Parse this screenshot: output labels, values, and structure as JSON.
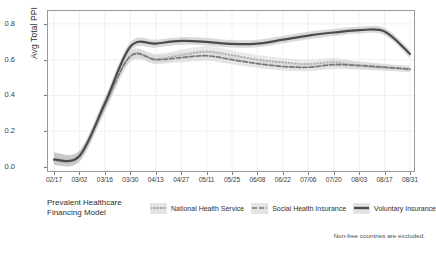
{
  "chart_data": {
    "type": "line",
    "title": "",
    "xlabel": "",
    "ylabel": "Avg Total PPI",
    "ylim": [
      0.0,
      0.85
    ],
    "yticks": [
      0.0,
      0.2,
      0.4,
      0.6,
      0.8
    ],
    "ytick_labels": [
      "0.0",
      "0.2",
      "0.4",
      "0.6",
      "0.8"
    ],
    "grid": true,
    "legend_position": "bottom-left",
    "legend_title": "Prevalent Healthcare Financing Model",
    "caption": "Non-free countries are excluded.",
    "x": [
      "02/17",
      "03/02",
      "03/16",
      "03/30",
      "04/13",
      "04/27",
      "05/11",
      "05/25",
      "06/08",
      "06/22",
      "07/06",
      "07/20",
      "08/03",
      "08/17",
      "08/31"
    ],
    "categories": [
      "02/17",
      "03/02",
      "03/16",
      "03/30",
      "04/13",
      "04/27",
      "05/11",
      "05/25",
      "06/08",
      "06/22",
      "07/06",
      "07/20",
      "08/03",
      "08/17",
      "08/31"
    ],
    "series": [
      {
        "name": "National Health Service",
        "style": "dotted",
        "color": "#8c8c8c",
        "band_color": "#d8d8d8",
        "values": [
          0.035,
          0.055,
          0.34,
          0.615,
          0.605,
          0.625,
          0.645,
          0.625,
          0.6,
          0.585,
          0.575,
          0.585,
          0.565,
          0.555,
          0.545
        ],
        "band_lower": [
          0.01,
          0.03,
          0.305,
          0.585,
          0.58,
          0.598,
          0.615,
          0.598,
          0.575,
          0.56,
          0.552,
          0.56,
          0.545,
          0.538,
          0.53
        ],
        "band_upper": [
          0.075,
          0.085,
          0.375,
          0.645,
          0.632,
          0.655,
          0.676,
          0.652,
          0.626,
          0.61,
          0.6,
          0.61,
          0.588,
          0.575,
          0.562
        ]
      },
      {
        "name": "Social Health Insurance",
        "style": "dashed",
        "color": "#777777",
        "band_color": "#cfcfcf",
        "values": [
          0.04,
          0.06,
          0.345,
          0.62,
          0.6,
          0.612,
          0.622,
          0.6,
          0.578,
          0.562,
          0.558,
          0.572,
          0.568,
          0.558,
          0.548
        ],
        "band_lower": [
          0.012,
          0.032,
          0.312,
          0.592,
          0.576,
          0.586,
          0.594,
          0.575,
          0.555,
          0.54,
          0.536,
          0.548,
          0.546,
          0.54,
          0.532
        ],
        "band_upper": [
          0.08,
          0.09,
          0.38,
          0.65,
          0.628,
          0.64,
          0.652,
          0.628,
          0.604,
          0.586,
          0.582,
          0.598,
          0.592,
          0.578,
          0.566
        ]
      },
      {
        "name": "Voluntary Insurance",
        "style": "solid",
        "color": "#4b4b4b",
        "band_color": "#b9b9b9",
        "values": [
          0.042,
          0.062,
          0.355,
          0.672,
          0.69,
          0.705,
          0.7,
          0.688,
          0.69,
          0.712,
          0.735,
          0.752,
          0.765,
          0.758,
          0.632
        ],
        "band_lower": [
          0.012,
          0.034,
          0.322,
          0.648,
          0.668,
          0.684,
          0.68,
          0.668,
          0.67,
          0.692,
          0.715,
          0.733,
          0.747,
          0.738,
          0.61
        ],
        "band_upper": [
          0.082,
          0.092,
          0.39,
          0.698,
          0.712,
          0.726,
          0.722,
          0.71,
          0.712,
          0.733,
          0.756,
          0.772,
          0.784,
          0.778,
          0.656
        ]
      }
    ]
  },
  "axis": {
    "y_label": "Avg Total PPI",
    "y_ticks": [
      "0.8",
      "0.6",
      "0.4",
      "0.2",
      "0.0"
    ],
    "x_ticks": [
      "02/17",
      "03/02",
      "03/16",
      "03/30",
      "04/13",
      "04/27",
      "05/11",
      "05/25",
      "06/08",
      "06/22",
      "07/06",
      "07/20",
      "08/03",
      "08/17",
      "08/31"
    ]
  },
  "legend": {
    "title_line1": "Prevalent Healthcare",
    "title_line2": "Financing Model",
    "entries": [
      {
        "label": "National Health Service",
        "key": "dotted-line-key"
      },
      {
        "label": "Social Health Insurance",
        "key": "dashed-line-key"
      },
      {
        "label": "Voluntary Insurance",
        "key": "solid-line-key"
      }
    ]
  },
  "footnote": {
    "text": "Non-free countries are excluded."
  }
}
